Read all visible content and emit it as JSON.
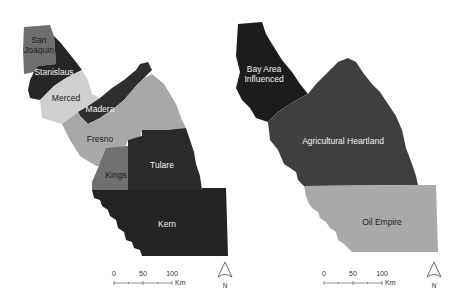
{
  "maps": [
    {
      "name": "counties",
      "regions": [
        {
          "id": "san-joaquin",
          "label": "San Joaquin",
          "line1": "San",
          "line2": "Joaquin",
          "color": "#6e6e6e"
        },
        {
          "id": "stanislaus",
          "label": "Stanislaus",
          "color": "#262626"
        },
        {
          "id": "merced",
          "label": "Merced",
          "color": "#cfcfcf"
        },
        {
          "id": "madera",
          "label": "Madera",
          "color": "#2e2e2e"
        },
        {
          "id": "fresno",
          "label": "Fresno",
          "color": "#a8a8a8"
        },
        {
          "id": "kings",
          "label": "Kings",
          "color": "#707070"
        },
        {
          "id": "tulare",
          "label": "Tulare",
          "color": "#2a2a2a"
        },
        {
          "id": "kern",
          "label": "Kern",
          "color": "#232323"
        }
      ],
      "scale_bar": {
        "ticks": [
          "0",
          "50",
          "100"
        ],
        "unit": "Km"
      },
      "north_arrow": {
        "label": "N"
      }
    },
    {
      "name": "subregions",
      "regions": [
        {
          "id": "bay-area-influenced",
          "label": "Bay Area Influenced",
          "line1": "Bay Area",
          "line2": "Influenced",
          "color": "#1c1c1c"
        },
        {
          "id": "agricultural-heartland",
          "label": "Agricultural Heartland",
          "color": "#3f3f3f"
        },
        {
          "id": "oil-empire",
          "label": "Oil Empire",
          "color": "#a9a9a9"
        }
      ],
      "scale_bar": {
        "ticks": [
          "0",
          "50",
          "100"
        ],
        "unit": "Km"
      },
      "north_arrow": {
        "label": "N"
      }
    }
  ]
}
